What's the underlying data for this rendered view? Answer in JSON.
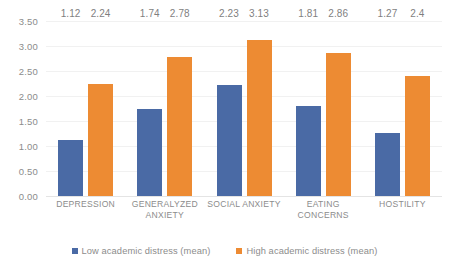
{
  "chart_data": {
    "type": "bar",
    "title": "",
    "subtitle": "",
    "xlabel": "",
    "ylabel": "",
    "ylim": [
      0,
      3.5
    ],
    "grid": true,
    "legend_position": "bottom",
    "categories": [
      "DEPRESSION",
      "GENERALYZED ANXIETY",
      "SOCIAL ANXIETY",
      "EATING CONCERNS",
      "HOSTILITY"
    ],
    "yticks": [
      "0.00",
      "0.50",
      "1.00",
      "1.50",
      "2.00",
      "2.50",
      "3.00",
      "3.50"
    ],
    "ytick_values": [
      0,
      0.5,
      1.0,
      1.5,
      2.0,
      2.5,
      3.0,
      3.5
    ],
    "series": [
      {
        "name": "Low academic distress (mean)",
        "color": "#4a6aa5",
        "values": [
          1.12,
          1.74,
          2.23,
          1.81,
          1.27
        ],
        "labels": [
          "1.12",
          "1.74",
          "2.23",
          "1.81",
          "1.27"
        ]
      },
      {
        "name": "High academic distress (mean)",
        "color": "#ed8b33",
        "values": [
          2.24,
          2.78,
          3.13,
          2.86,
          2.4
        ],
        "labels": [
          "2.24",
          "2.78",
          "3.13",
          "2.86",
          "2.4"
        ]
      }
    ]
  },
  "legend": {
    "items": [
      {
        "label": "Low academic distress (mean)",
        "color": "#4a6aa5"
      },
      {
        "label": "High academic distress (mean)",
        "color": "#ed8b33"
      }
    ]
  },
  "colors": {
    "low_series": "#4a6aa5",
    "high_series": "#ed8b33",
    "text": "#8c8c8c",
    "gridline": "#f1f1f1",
    "background": "#ffffff"
  }
}
